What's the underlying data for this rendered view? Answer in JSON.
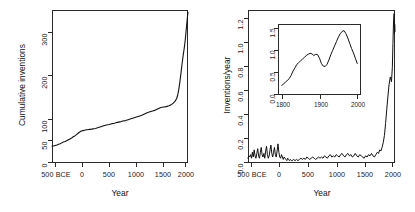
{
  "figure": {
    "panels": [
      "cumulative",
      "rate"
    ]
  },
  "chart_data": [
    {
      "type": "line",
      "id": "cumulative",
      "title": "",
      "xlabel": "Year",
      "ylabel": "Cumulative inventions",
      "xlim": [
        -500,
        2000
      ],
      "ylim": [
        0,
        350
      ],
      "xticks": [
        -500,
        0,
        500,
        1000,
        1500,
        2000
      ],
      "xticklabels": [
        "500 BCE",
        "0",
        "500",
        "1000",
        "1500",
        "2000"
      ],
      "yticks": [
        0,
        50,
        100,
        200,
        300
      ],
      "yticklabels": [
        "0",
        "50",
        "100",
        "200",
        "300"
      ],
      "grid": false,
      "legend": "none",
      "x": [
        -500,
        -470,
        -440,
        -410,
        -380,
        -350,
        -320,
        -290,
        -260,
        -230,
        -200,
        -170,
        -140,
        -110,
        -80,
        -50,
        -20,
        10,
        40,
        70,
        100,
        130,
        160,
        190,
        220,
        250,
        300,
        350,
        400,
        450,
        500,
        550,
        600,
        650,
        700,
        750,
        800,
        850,
        900,
        950,
        1000,
        1050,
        1100,
        1150,
        1200,
        1250,
        1300,
        1350,
        1400,
        1450,
        1500,
        1550,
        1600,
        1650,
        1700,
        1730,
        1760,
        1790,
        1810,
        1830,
        1850,
        1870,
        1890,
        1910,
        1930,
        1950,
        1965,
        1980,
        1990,
        2000
      ],
      "values": [
        39,
        39,
        40,
        41,
        43,
        44,
        46,
        48,
        49,
        51,
        53,
        55,
        57,
        60,
        62,
        65,
        68,
        71,
        73,
        74,
        75,
        76,
        76,
        77,
        77,
        78,
        79,
        81,
        83,
        85,
        87,
        88,
        90,
        91,
        93,
        94,
        96,
        97,
        99,
        101,
        103,
        105,
        107,
        109,
        112,
        115,
        117,
        119,
        121,
        124,
        127,
        128,
        129,
        131,
        134,
        137,
        141,
        147,
        155,
        168,
        185,
        205,
        226,
        245,
        262,
        282,
        302,
        322,
        334,
        345
      ]
    },
    {
      "type": "line",
      "id": "rate",
      "title": "",
      "xlabel": "Year",
      "ylabel": "Inventions/year",
      "xlim": [
        -500,
        2000
      ],
      "ylim": [
        0,
        1.28
      ],
      "xticks": [
        -500,
        0,
        500,
        1000,
        1500,
        2000
      ],
      "xticklabels": [
        "500 BCE",
        "0",
        "500",
        "1000",
        "1500",
        "2000"
      ],
      "yticks": [
        0.0,
        0.2,
        0.4,
        0.6,
        0.8,
        1.0,
        1.2
      ],
      "yticklabels": [
        "0.0",
        "0.2",
        "0.4",
        "0.6",
        "0.8",
        "1.0",
        "1.2"
      ],
      "grid": false,
      "legend": "none",
      "x": [
        -500,
        -485,
        -470,
        -455,
        -440,
        -425,
        -410,
        -395,
        -380,
        -365,
        -350,
        -335,
        -320,
        -305,
        -290,
        -275,
        -260,
        -245,
        -230,
        -215,
        -200,
        -185,
        -170,
        -155,
        -140,
        -125,
        -110,
        -95,
        -80,
        -65,
        -50,
        -35,
        -20,
        -5,
        10,
        25,
        40,
        55,
        70,
        85,
        100,
        115,
        130,
        145,
        160,
        175,
        190,
        205,
        220,
        235,
        250,
        275,
        300,
        325,
        350,
        375,
        400,
        425,
        450,
        475,
        500,
        525,
        550,
        575,
        600,
        625,
        650,
        675,
        700,
        725,
        750,
        775,
        800,
        825,
        850,
        875,
        900,
        925,
        950,
        975,
        1000,
        1025,
        1050,
        1075,
        1100,
        1125,
        1150,
        1175,
        1200,
        1225,
        1250,
        1275,
        1300,
        1325,
        1350,
        1375,
        1400,
        1425,
        1450,
        1475,
        1500,
        1525,
        1550,
        1575,
        1600,
        1625,
        1650,
        1675,
        1700,
        1720,
        1740,
        1760,
        1780,
        1800,
        1820,
        1840,
        1860,
        1880,
        1900,
        1920,
        1940,
        1955,
        1965,
        1975,
        1985,
        1990,
        1995,
        2000
      ],
      "values": [
        0.04,
        0.06,
        0.05,
        0.07,
        0.04,
        0.09,
        0.05,
        0.11,
        0.06,
        0.04,
        0.08,
        0.12,
        0.06,
        0.04,
        0.09,
        0.13,
        0.07,
        0.05,
        0.08,
        0.04,
        0.1,
        0.14,
        0.07,
        0.04,
        0.06,
        0.11,
        0.15,
        0.08,
        0.05,
        0.09,
        0.13,
        0.07,
        0.05,
        0.1,
        0.16,
        0.09,
        0.05,
        0.04,
        0.07,
        0.05,
        0.03,
        0.05,
        0.04,
        0.03,
        0.02,
        0.04,
        0.03,
        0.02,
        0.03,
        0.02,
        0.02,
        0.03,
        0.02,
        0.03,
        0.02,
        0.03,
        0.04,
        0.03,
        0.04,
        0.03,
        0.05,
        0.04,
        0.03,
        0.04,
        0.05,
        0.04,
        0.03,
        0.04,
        0.05,
        0.04,
        0.05,
        0.04,
        0.06,
        0.05,
        0.04,
        0.06,
        0.07,
        0.05,
        0.06,
        0.05,
        0.07,
        0.06,
        0.05,
        0.07,
        0.08,
        0.06,
        0.05,
        0.07,
        0.08,
        0.06,
        0.07,
        0.05,
        0.06,
        0.08,
        0.06,
        0.05,
        0.07,
        0.06,
        0.05,
        0.04,
        0.06,
        0.05,
        0.07,
        0.06,
        0.08,
        0.06,
        0.05,
        0.07,
        0.09,
        0.08,
        0.11,
        0.1,
        0.13,
        0.17,
        0.23,
        0.33,
        0.45,
        0.56,
        0.66,
        0.72,
        0.68,
        0.8,
        1.0,
        1.18,
        1.25,
        1.08,
        1.16,
        1.1,
        1.05
      ],
      "inset": {
        "type": "line",
        "xlabel": "",
        "ylabel": "",
        "xlim": [
          1790,
          2010
        ],
        "ylim": [
          0,
          1.62
        ],
        "xticks": [
          1800,
          1900,
          2000
        ],
        "xticklabels": [
          "1800",
          "1900",
          "2000"
        ],
        "yticks": [
          0.0,
          0.5,
          1.0,
          1.5
        ],
        "yticklabels": [
          "0.0",
          "0.5",
          "1.0",
          "1.5"
        ],
        "grid": false,
        "x": [
          1800,
          1805,
          1810,
          1815,
          1820,
          1825,
          1830,
          1835,
          1840,
          1845,
          1850,
          1855,
          1860,
          1865,
          1870,
          1875,
          1880,
          1885,
          1890,
          1895,
          1900,
          1905,
          1910,
          1915,
          1920,
          1925,
          1930,
          1935,
          1940,
          1945,
          1950,
          1955,
          1960,
          1965,
          1970,
          1975,
          1980,
          1985,
          1990,
          1995,
          2000
        ],
        "values": [
          0.22,
          0.25,
          0.3,
          0.33,
          0.38,
          0.45,
          0.55,
          0.62,
          0.7,
          0.74,
          0.78,
          0.82,
          0.86,
          0.9,
          0.93,
          0.95,
          0.94,
          0.9,
          0.93,
          0.92,
          0.84,
          0.72,
          0.66,
          0.65,
          0.7,
          0.8,
          0.92,
          1.02,
          1.12,
          1.22,
          1.32,
          1.4,
          1.45,
          1.47,
          1.4,
          1.3,
          1.18,
          1.06,
          0.96,
          0.84,
          0.72
        ]
      }
    }
  ]
}
